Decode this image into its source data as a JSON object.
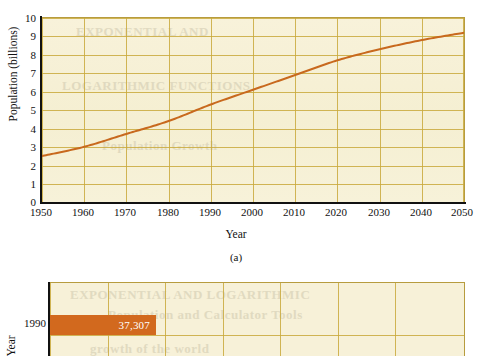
{
  "figure_a": {
    "caption": "(a)",
    "xlabel": "Year",
    "ylabel": "Population (billions)",
    "yticks": [
      "10",
      "9",
      "8",
      "7",
      "6",
      "5",
      "4",
      "3",
      "2",
      "1",
      "0"
    ],
    "xticks": [
      "1950",
      "1960",
      "1970",
      "1980",
      "1990",
      "2000",
      "2010",
      "2020",
      "2030",
      "2040",
      "2050"
    ]
  },
  "figure_b": {
    "ylabel": "Year",
    "category": "1990",
    "bar_value": "37,307"
  },
  "colors": {
    "line": "#c8691e",
    "bar": "#d2691e",
    "grid": "#c9a93c",
    "paper": "#f7f1d8",
    "frame": "#b79c3e",
    "text": "#111111"
  },
  "chart_data": [
    {
      "type": "line",
      "title": "",
      "xlabel": "Year",
      "ylabel": "Population (billions)",
      "xlim": [
        1950,
        2050
      ],
      "ylim": [
        0,
        10
      ],
      "grid": true,
      "legend": "none",
      "annotations": [
        "(a)"
      ],
      "x": [
        1950,
        1960,
        1970,
        1980,
        1990,
        2000,
        2010,
        2020,
        2030,
        2040,
        2050
      ],
      "xtick_labels": [
        "1950",
        "1960",
        "1970",
        "1980",
        "1990",
        "2000",
        "2010",
        "2020",
        "2030",
        "2040",
        "2050"
      ],
      "ytick_labels": [
        "0",
        "1",
        "2",
        "3",
        "4",
        "5",
        "6",
        "7",
        "8",
        "9",
        "10"
      ],
      "series": [
        {
          "name": "World population",
          "values": [
            2.5,
            3.0,
            3.7,
            4.4,
            5.3,
            6.1,
            6.9,
            7.7,
            8.3,
            8.8,
            9.2
          ]
        }
      ]
    },
    {
      "type": "bar",
      "orientation": "horizontal",
      "title": "",
      "xlabel": "",
      "ylabel": "Year",
      "grid": true,
      "legend": "none",
      "categories": [
        "1990"
      ],
      "values": [
        37307
      ],
      "data_labels": [
        "37,307"
      ],
      "note": "Only the top portion of this chart is visible in the screenshot."
    }
  ]
}
